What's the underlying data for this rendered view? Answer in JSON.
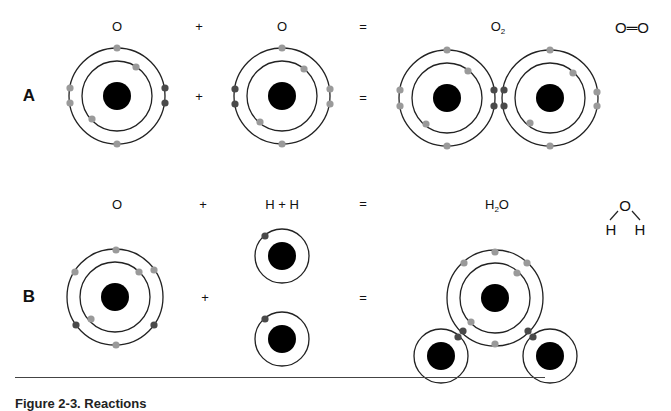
{
  "figure": {
    "caption": "Figure 2-3. Reactions",
    "colors": {
      "nucleus": "#000000",
      "orbit": "#222222",
      "electron_unshared": "#9a9a9a",
      "electron_shared": "#4a4a4a"
    }
  },
  "row_a": {
    "label": "A",
    "header": {
      "reactant_1": "O",
      "plus": "+",
      "reactant_2": "O",
      "equals": "=",
      "product_formula": "O",
      "product_subscript": "2",
      "structural_formula": "O═O"
    },
    "operators": {
      "plus": "+",
      "equals": "="
    },
    "atoms": [
      {
        "name": "oxygen-atom-1",
        "element": "O",
        "shells": 2,
        "electrons": 8
      },
      {
        "name": "oxygen-atom-2",
        "element": "O",
        "shells": 2,
        "electrons": 8
      },
      {
        "name": "o2-molecule",
        "element": "O2",
        "bond": "double covalent"
      }
    ]
  },
  "row_b": {
    "label": "B",
    "header": {
      "reactant_1": "O",
      "plus": "+",
      "reactant_2": "H + H",
      "equals": "=",
      "product_formula_1": "H",
      "product_subscript": "2",
      "product_formula_2": "O",
      "structure_top": "O",
      "structure_left": "H",
      "structure_right": "H"
    },
    "operators": {
      "plus": "+",
      "equals": "="
    },
    "atoms": [
      {
        "name": "oxygen-atom",
        "element": "O",
        "shells": 2,
        "electrons": 8
      },
      {
        "name": "hydrogen-atom-1",
        "element": "H",
        "shells": 1,
        "electrons": 1
      },
      {
        "name": "hydrogen-atom-2",
        "element": "H",
        "shells": 1,
        "electrons": 1
      },
      {
        "name": "h2o-molecule",
        "element": "H2O",
        "bond": "two single covalent"
      }
    ]
  }
}
